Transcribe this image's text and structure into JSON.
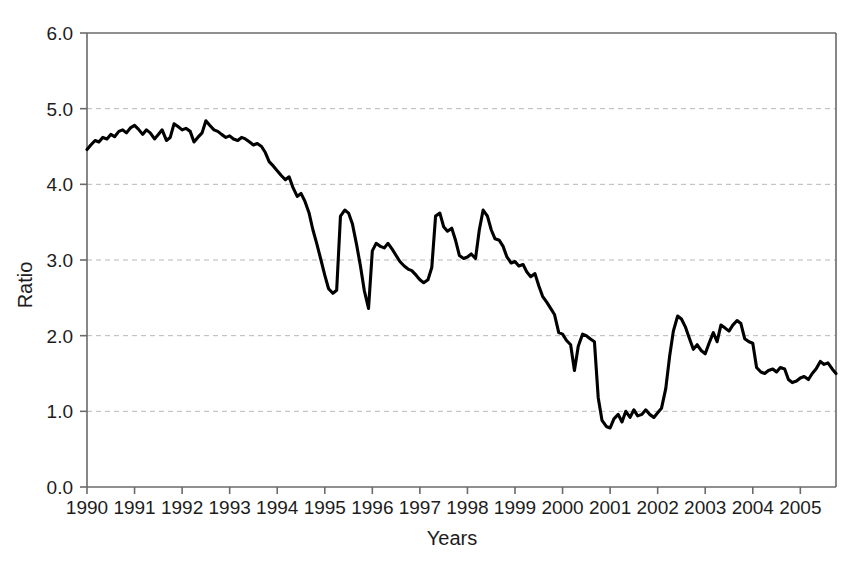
{
  "chart_data": {
    "type": "line",
    "title": "",
    "xlabel": "Years",
    "ylabel": "Ratio",
    "xlim": [
      1990.0,
      2005.75
    ],
    "ylim": [
      0.0,
      6.0
    ],
    "grid": "horizontal-dashed",
    "legend": "none",
    "line_color": "#000000",
    "x_tick_labels": [
      "1990",
      "1991",
      "1992",
      "1993",
      "1994",
      "1995",
      "1996",
      "1997",
      "1998",
      "1999",
      "2000",
      "2001",
      "2002",
      "2003",
      "2004",
      "2005"
    ],
    "x_tick_values": [
      1990,
      1991,
      1992,
      1993,
      1994,
      1995,
      1996,
      1997,
      1998,
      1999,
      2000,
      2001,
      2002,
      2003,
      2004,
      2005
    ],
    "y_tick_labels": [
      "0.0",
      "1.0",
      "2.0",
      "3.0",
      "4.0",
      "5.0",
      "6.0"
    ],
    "y_tick_values": [
      0.0,
      1.0,
      2.0,
      3.0,
      4.0,
      5.0,
      6.0
    ],
    "series": [
      {
        "name": "Ratio",
        "x": [
          1990.0,
          1990.08,
          1990.17,
          1990.25,
          1990.33,
          1990.42,
          1990.5,
          1990.58,
          1990.67,
          1990.75,
          1990.83,
          1990.92,
          1991.0,
          1991.08,
          1991.17,
          1991.25,
          1991.33,
          1991.42,
          1991.5,
          1991.58,
          1991.67,
          1991.75,
          1991.83,
          1991.92,
          1992.0,
          1992.08,
          1992.17,
          1992.25,
          1992.33,
          1992.42,
          1992.5,
          1992.58,
          1992.67,
          1992.75,
          1992.83,
          1992.92,
          1993.0,
          1993.08,
          1993.17,
          1993.25,
          1993.33,
          1993.42,
          1993.5,
          1993.58,
          1993.67,
          1993.75,
          1993.83,
          1993.92,
          1994.0,
          1994.08,
          1994.17,
          1994.25,
          1994.33,
          1994.42,
          1994.5,
          1994.58,
          1994.67,
          1994.75,
          1994.83,
          1994.92,
          1995.0,
          1995.08,
          1995.17,
          1995.25,
          1995.33,
          1995.42,
          1995.5,
          1995.58,
          1995.67,
          1995.75,
          1995.83,
          1995.92,
          1996.0,
          1996.08,
          1996.17,
          1996.25,
          1996.33,
          1996.42,
          1996.5,
          1996.58,
          1996.67,
          1996.75,
          1996.83,
          1996.92,
          1997.0,
          1997.08,
          1997.17,
          1997.25,
          1997.33,
          1997.42,
          1997.5,
          1997.58,
          1997.67,
          1997.75,
          1997.83,
          1997.92,
          1998.0,
          1998.08,
          1998.17,
          1998.25,
          1998.33,
          1998.42,
          1998.5,
          1998.58,
          1998.67,
          1998.75,
          1998.83,
          1998.92,
          1999.0,
          1999.08,
          1999.17,
          1999.25,
          1999.33,
          1999.42,
          1999.5,
          1999.58,
          1999.67,
          1999.75,
          1999.83,
          1999.92,
          2000.0,
          2000.08,
          2000.17,
          2000.25,
          2000.33,
          2000.42,
          2000.5,
          2000.58,
          2000.67,
          2000.75,
          2000.83,
          2000.92,
          2001.0,
          2001.08,
          2001.17,
          2001.25,
          2001.33,
          2001.42,
          2001.5,
          2001.58,
          2001.67,
          2001.75,
          2001.83,
          2001.92,
          2002.0,
          2002.08,
          2002.17,
          2002.25,
          2002.33,
          2002.42,
          2002.5,
          2002.58,
          2002.67,
          2002.75,
          2002.83,
          2002.92,
          2003.0,
          2003.08,
          2003.17,
          2003.25,
          2003.33,
          2003.42,
          2003.5,
          2003.58,
          2003.67,
          2003.75,
          2003.83,
          2003.92,
          2004.0,
          2004.08,
          2004.17,
          2004.25,
          2004.33,
          2004.42,
          2004.5,
          2004.58,
          2004.67,
          2004.75,
          2004.83,
          2004.92,
          2005.0,
          2005.08,
          2005.17,
          2005.25,
          2005.33,
          2005.42,
          2005.5,
          2005.58,
          2005.67,
          2005.75
        ],
        "values": [
          4.46,
          4.52,
          4.58,
          4.56,
          4.62,
          4.6,
          4.66,
          4.63,
          4.7,
          4.72,
          4.68,
          4.75,
          4.78,
          4.73,
          4.66,
          4.72,
          4.68,
          4.6,
          4.66,
          4.72,
          4.58,
          4.62,
          4.8,
          4.76,
          4.72,
          4.74,
          4.7,
          4.56,
          4.62,
          4.68,
          4.84,
          4.78,
          4.72,
          4.7,
          4.66,
          4.62,
          4.64,
          4.6,
          4.58,
          4.62,
          4.6,
          4.56,
          4.52,
          4.54,
          4.5,
          4.42,
          4.3,
          4.24,
          4.18,
          4.12,
          4.06,
          4.1,
          3.96,
          3.84,
          3.88,
          3.78,
          3.62,
          3.4,
          3.22,
          3.0,
          2.8,
          2.62,
          2.56,
          2.6,
          3.58,
          3.66,
          3.62,
          3.48,
          3.2,
          2.92,
          2.6,
          2.36,
          3.12,
          3.22,
          3.18,
          3.16,
          3.22,
          3.14,
          3.06,
          2.98,
          2.92,
          2.88,
          2.86,
          2.8,
          2.74,
          2.7,
          2.74,
          2.9,
          3.58,
          3.62,
          3.44,
          3.38,
          3.42,
          3.26,
          3.06,
          3.02,
          3.04,
          3.08,
          3.02,
          3.4,
          3.66,
          3.58,
          3.4,
          3.28,
          3.26,
          3.18,
          3.04,
          2.96,
          2.98,
          2.92,
          2.94,
          2.84,
          2.78,
          2.82,
          2.66,
          2.52,
          2.44,
          2.36,
          2.28,
          2.04,
          2.02,
          1.94,
          1.88,
          1.54,
          1.86,
          2.02,
          2.0,
          1.96,
          1.92,
          1.18,
          0.88,
          0.8,
          0.78,
          0.9,
          0.96,
          0.86,
          1.0,
          0.92,
          1.02,
          0.94,
          0.96,
          1.02,
          0.96,
          0.92,
          0.98,
          1.04,
          1.3,
          1.72,
          2.06,
          2.26,
          2.22,
          2.12,
          1.96,
          1.82,
          1.88,
          1.8,
          1.76,
          1.9,
          2.04,
          1.92,
          2.14,
          2.1,
          2.06,
          2.14,
          2.2,
          2.16,
          1.96,
          1.92,
          1.9,
          1.58,
          1.52,
          1.5,
          1.54,
          1.56,
          1.52,
          1.58,
          1.56,
          1.42,
          1.38,
          1.4,
          1.44,
          1.46,
          1.42,
          1.5,
          1.56,
          1.66,
          1.62,
          1.64,
          1.56,
          1.5
        ]
      }
    ]
  },
  "figure": {
    "background_color": "#ffffff",
    "grid_color": "#b8b8b8",
    "axis_color": "#6a6a6a"
  }
}
